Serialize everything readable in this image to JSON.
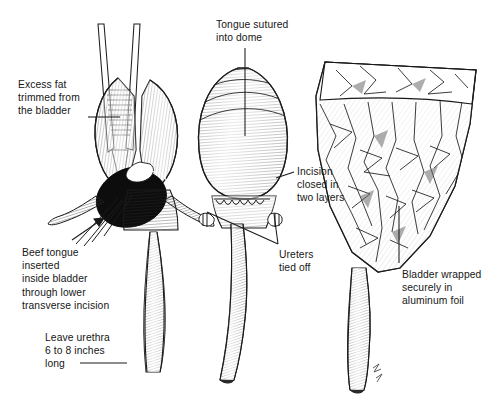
{
  "figure": {
    "style": "pen-and-ink line engraving",
    "background_color": "#ffffff",
    "ink_color": "#1a1a1a",
    "panels": [
      {
        "id": "panel-1",
        "name": "bladder-with-forceps-and-beef-tongue",
        "description": "Bladder held open by forceps with beef tongue inserted through lower transverse incision; long urethra below"
      },
      {
        "id": "panel-2",
        "name": "bladder-closed-and-sutured",
        "description": "Inflated bladder with tongue sutured into dome, incision closed in two layers, ureters tied off"
      },
      {
        "id": "panel-3",
        "name": "bladder-wrapped-in-foil",
        "description": "Bladder wrapped securely in crumpled aluminum foil with urethra protruding below"
      }
    ],
    "labels": [
      {
        "id": "label-excess-fat",
        "name": "label-excess-fat",
        "text": "Excess fat\ntrimmed from\nthe bladder",
        "x": 18,
        "y": 78,
        "align": "left",
        "leader": "horizontal line from text to left lobe of bladder"
      },
      {
        "id": "label-beef-tongue",
        "name": "label-beef-tongue",
        "text": "Beef tongue\ninserted\ninside bladder\nthrough lower\ntransverse incision",
        "x": 22,
        "y": 246,
        "align": "left",
        "leader": "arrow pointing up-right to dark tongue mass"
      },
      {
        "id": "label-leave-urethra",
        "name": "label-leave-urethra",
        "text": "Leave urethra\n6 to 8 inches\nlong",
        "x": 45,
        "y": 331,
        "align": "left",
        "leader": "short horizontal rule to urethra"
      },
      {
        "id": "label-tongue-sutured",
        "name": "label-tongue-sutured",
        "text": "Tongue sutured\ninto dome",
        "x": 216,
        "y": 18,
        "align": "left",
        "leader": "vertical line down into bladder dome"
      },
      {
        "id": "label-incision-closed",
        "name": "label-incision-closed",
        "text": "Incision\nclosed in\ntwo layers",
        "x": 297,
        "y": 165,
        "align": "left",
        "leader": "short line left to suture row"
      },
      {
        "id": "label-ureters-tied",
        "name": "label-ureters-tied",
        "text": "Ureters\ntied off",
        "x": 279,
        "y": 248,
        "align": "left",
        "leader": "two lines up-left to tied ureter stumps"
      },
      {
        "id": "label-bladder-wrapped",
        "name": "label-bladder-wrapped",
        "text": "Bladder wrapped\nsecurely in\naluminum foil",
        "x": 402,
        "y": 268,
        "align": "left",
        "leader": "vertical line up into foil wrapping"
      }
    ],
    "signature": "artist monogram at lower right of third figure"
  }
}
